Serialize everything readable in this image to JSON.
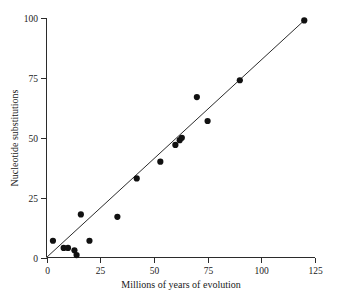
{
  "chart_data": {
    "type": "scatter",
    "title": "",
    "xlabel": "Millions of years of evolution",
    "ylabel": "Nucleotide substitutions",
    "xlim": [
      0,
      125
    ],
    "ylim": [
      0,
      100
    ],
    "xticks": [
      0,
      25,
      50,
      75,
      100,
      125
    ],
    "yticks": [
      0,
      25,
      50,
      75,
      100
    ],
    "xtick_labels": [
      "0",
      "25",
      "50",
      "75",
      "100",
      "125"
    ],
    "ytick_labels": [
      "0",
      "25",
      "50",
      "75",
      "100"
    ],
    "grid": false,
    "legend": null,
    "points": [
      {
        "x": 3,
        "y": 7
      },
      {
        "x": 8,
        "y": 4
      },
      {
        "x": 10,
        "y": 4
      },
      {
        "x": 13,
        "y": 3
      },
      {
        "x": 14,
        "y": 1
      },
      {
        "x": 16,
        "y": 18
      },
      {
        "x": 20,
        "y": 7
      },
      {
        "x": 33,
        "y": 17
      },
      {
        "x": 42,
        "y": 33
      },
      {
        "x": 53,
        "y": 40
      },
      {
        "x": 60,
        "y": 47
      },
      {
        "x": 62,
        "y": 49
      },
      {
        "x": 63,
        "y": 50
      },
      {
        "x": 70,
        "y": 67
      },
      {
        "x": 75,
        "y": 57
      },
      {
        "x": 90,
        "y": 74
      },
      {
        "x": 120,
        "y": 99
      }
    ],
    "fit_line": {
      "type": "linear",
      "from": {
        "x": 0,
        "y": 0
      },
      "to": {
        "x": 120,
        "y": 99
      },
      "slope": 0.825,
      "intercept": 0
    }
  }
}
